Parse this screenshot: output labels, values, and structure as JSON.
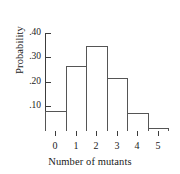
{
  "chart_data": {
    "type": "bar",
    "title": "",
    "subtitle": "",
    "xlabel": "Number of mutants",
    "ylabel": "Probability",
    "categories": [
      "0",
      "1",
      "2",
      "3",
      "4",
      "5"
    ],
    "values": [
      0.08,
      0.265,
      0.345,
      0.215,
      0.07,
      0.01
    ],
    "ylim": [
      0,
      0.4
    ],
    "ytick_values": [
      0.1,
      0.2,
      0.3,
      0.4
    ],
    "ytick_labels": [
      ".10",
      ".20",
      ".30",
      ".40"
    ],
    "xtick_labels": [
      "0",
      "1",
      "2",
      "3",
      "4",
      "5"
    ],
    "grid": false,
    "legend": null,
    "bar_edge_color": "#555555",
    "bar_fill_color": "#ffffff",
    "axis_color": "#3c3c3c",
    "background_color": "#ffffff"
  }
}
